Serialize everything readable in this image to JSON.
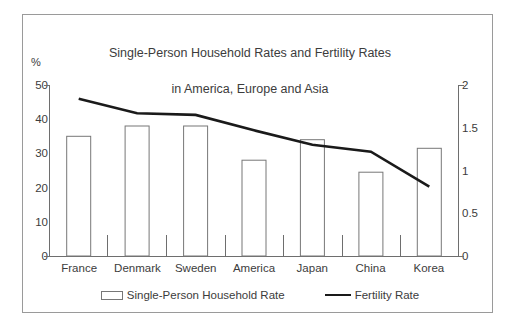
{
  "chart_data": {
    "type": "bar",
    "title": "Single-Person Household Rates and Fertility Rates\nin America, Europe and Asia",
    "title_line1": "Single-Person Household Rates and Fertility Rates",
    "title_line2": "in America, Europe and Asia",
    "xlabel": "",
    "ylabel": "%",
    "y2label": "",
    "categories": [
      "France",
      "Denmark",
      "Sweden",
      "America",
      "Japan",
      "China",
      "Korea"
    ],
    "ylim": [
      0,
      50
    ],
    "y2lim": [
      0,
      2
    ],
    "yticks": [
      "0",
      "10",
      "20",
      "30",
      "40",
      "50"
    ],
    "y2ticks": [
      "0",
      "0.5",
      "1",
      "1.5",
      "2"
    ],
    "grid": false,
    "legend_position": "bottom",
    "series": [
      {
        "name": "Single-Person Household Rate",
        "kind": "bar",
        "axis": "left",
        "color": "#ffffff",
        "edge_color": "#777777",
        "values": [
          35,
          38,
          38,
          28,
          34,
          24.5,
          31.5
        ]
      },
      {
        "name": "Fertility Rate",
        "kind": "line",
        "axis": "right",
        "color": "#1a1a1a",
        "values": [
          1.84,
          1.67,
          1.65,
          1.47,
          1.3,
          1.22,
          0.81
        ]
      }
    ]
  },
  "legend": {
    "items": [
      {
        "label": "Single-Person Household Rate",
        "swatch": "bar-swatch"
      },
      {
        "label": "Fertility Rate",
        "swatch": "line-swatch"
      }
    ]
  },
  "colors": {
    "frame": "#9a9a9a",
    "axis": "#6e6e6e",
    "bar_edge": "#777777",
    "line": "#1a1a1a",
    "text": "#3c3c3c",
    "background": "#ffffff"
  }
}
